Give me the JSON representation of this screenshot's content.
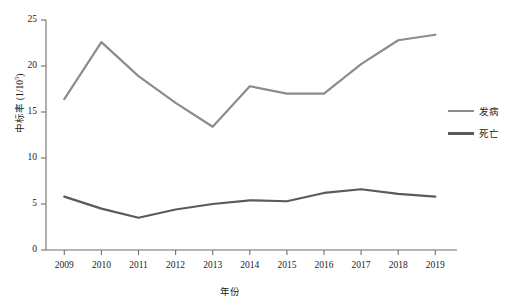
{
  "chart_data": {
    "type": "line",
    "title": "",
    "xlabel": "年份",
    "ylabel": "中标率 (1/10^5)",
    "ylabel_base": "中标率 (1/10",
    "ylabel_exponent": "5",
    "ylabel_close": ")",
    "categories": [
      "2009",
      "2010",
      "2011",
      "2012",
      "2013",
      "2014",
      "2015",
      "2016",
      "2017",
      "2018",
      "2019"
    ],
    "x": [
      2009,
      2010,
      2011,
      2012,
      2013,
      2014,
      2015,
      2016,
      2017,
      2018,
      2019
    ],
    "xlim": [
      2009,
      2019
    ],
    "ylim": [
      0,
      25
    ],
    "yticks": [
      0,
      5,
      10,
      15,
      20,
      25
    ],
    "ytick_labels": [
      "0",
      "5",
      "10",
      "15",
      "20",
      "25"
    ],
    "grid": false,
    "legend_position": "right",
    "series": [
      {
        "name": "发病",
        "color": "#8c8c8c",
        "values": [
          16.4,
          22.6,
          18.9,
          16.0,
          13.4,
          17.8,
          17.0,
          17.0,
          20.2,
          22.8,
          23.4
        ]
      },
      {
        "name": "死亡",
        "color": "#5a5a5a",
        "values": [
          5.8,
          4.5,
          3.5,
          4.4,
          5.0,
          5.4,
          5.3,
          6.2,
          6.6,
          6.1,
          5.8
        ]
      }
    ]
  },
  "axes": {
    "y_tick_0": "0",
    "y_tick_5": "5",
    "y_tick_10": "10",
    "y_tick_15": "15",
    "y_tick_20": "20",
    "y_tick_25": "25",
    "x_tick_2009": "2009",
    "x_tick_2010": "2010",
    "x_tick_2011": "2011",
    "x_tick_2012": "2012",
    "x_tick_2013": "2013",
    "x_tick_2014": "2014",
    "x_tick_2015": "2015",
    "x_tick_2016": "2016",
    "x_tick_2017": "2017",
    "x_tick_2018": "2018",
    "x_tick_2019": "2019"
  },
  "legend": {
    "items": [
      {
        "label": "发病",
        "color": "#8c8c8c"
      },
      {
        "label": "死亡",
        "color": "#5a5a5a"
      }
    ]
  },
  "style": {
    "axis_color": "#6e6e6e",
    "text_color": "#1a1a1a",
    "background": "#ffffff"
  }
}
